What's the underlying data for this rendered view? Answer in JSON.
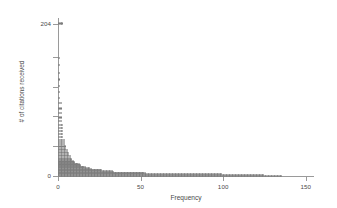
{
  "chart_data": {
    "type": "scatter",
    "title": "",
    "subtitle": "",
    "xlabel": "Frequency",
    "ylabel": "# of citations received",
    "xlim": [
      0,
      155
    ],
    "ylim": [
      0,
      212
    ],
    "xticks": [
      0,
      50,
      100,
      150
    ],
    "xticklabels": [
      "0",
      "50",
      "100",
      "150"
    ],
    "yticks": [
      0,
      204
    ],
    "yticklabels": [
      "0",
      "204"
    ],
    "grid": false,
    "legend": null,
    "marker": "open-circle",
    "marker_color": "#7d7d7d",
    "points": [
      {
        "citations": 0,
        "frequency": 149
      },
      {
        "citations": 1,
        "frequency": 137
      },
      {
        "citations": 2,
        "frequency": 109
      },
      {
        "citations": 3,
        "frequency": 58
      },
      {
        "citations": 4,
        "frequency": 57
      },
      {
        "citations": 5,
        "frequency": 37
      },
      {
        "citations": 6,
        "frequency": 36
      },
      {
        "citations": 7,
        "frequency": 29
      },
      {
        "citations": 8,
        "frequency": 28
      },
      {
        "citations": 9,
        "frequency": 22
      },
      {
        "citations": 10,
        "frequency": 21
      },
      {
        "citations": 11,
        "frequency": 18
      },
      {
        "citations": 12,
        "frequency": 17
      },
      {
        "citations": 13,
        "frequency": 15
      },
      {
        "citations": 14,
        "frequency": 15
      },
      {
        "citations": 15,
        "frequency": 14
      },
      {
        "citations": 16,
        "frequency": 13
      },
      {
        "citations": 17,
        "frequency": 11
      },
      {
        "citations": 18,
        "frequency": 11
      },
      {
        "citations": 19,
        "frequency": 10
      },
      {
        "citations": 21,
        "frequency": 9
      },
      {
        "citations": 22,
        "frequency": 9
      },
      {
        "citations": 24,
        "frequency": 8
      },
      {
        "citations": 26,
        "frequency": 8
      },
      {
        "citations": 28,
        "frequency": 7
      },
      {
        "citations": 30,
        "frequency": 7
      },
      {
        "citations": 32,
        "frequency": 6
      },
      {
        "citations": 34,
        "frequency": 6
      },
      {
        "citations": 36,
        "frequency": 5
      },
      {
        "citations": 39,
        "frequency": 5
      },
      {
        "citations": 42,
        "frequency": 4
      },
      {
        "citations": 45,
        "frequency": 4
      },
      {
        "citations": 48,
        "frequency": 4
      },
      {
        "citations": 52,
        "frequency": 3
      },
      {
        "citations": 56,
        "frequency": 3
      },
      {
        "citations": 60,
        "frequency": 3
      },
      {
        "citations": 64,
        "frequency": 3
      },
      {
        "citations": 68,
        "frequency": 3
      },
      {
        "citations": 73,
        "frequency": 2
      },
      {
        "citations": 78,
        "frequency": 2
      },
      {
        "citations": 84,
        "frequency": 2
      },
      {
        "citations": 90,
        "frequency": 2
      },
      {
        "citations": 97,
        "frequency": 2
      },
      {
        "citations": 104,
        "frequency": 1
      },
      {
        "citations": 112,
        "frequency": 1
      },
      {
        "citations": 120,
        "frequency": 1
      },
      {
        "citations": 129,
        "frequency": 1
      },
      {
        "citations": 138,
        "frequency": 1
      },
      {
        "citations": 148,
        "frequency": 1
      },
      {
        "citations": 158,
        "frequency": 1
      },
      {
        "citations": 204,
        "frequency": 3
      }
    ]
  }
}
